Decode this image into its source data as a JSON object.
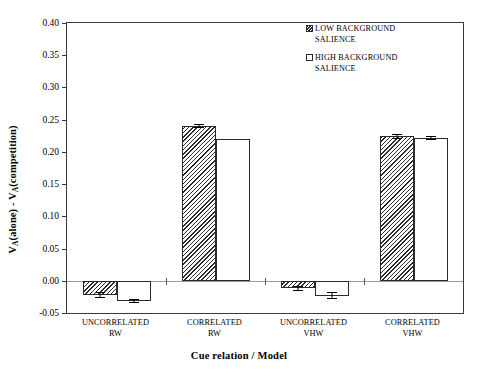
{
  "chart_data": {
    "type": "bar",
    "title": "",
    "xlabel": "Cue relation / Model",
    "ylabel": "Vₐ(alone) - Vₐ(competition)",
    "ylabel_parts": {
      "pre": "V",
      "sub": "A",
      "mid": "(alone) - V",
      "sub2": "A",
      "post": "(competition)"
    },
    "categories": [
      "UNCORRELATED\nRW",
      "CORRELATED\nRW",
      "UNCORRELATED\nVHW",
      "CORRELATED\nVHW"
    ],
    "series": [
      {
        "name": "LOW BACKGROUND\nSALIENCE",
        "swatch": "hatch",
        "values": [
          -0.022,
          0.24,
          -0.012,
          0.224
        ],
        "errors": [
          0.005,
          0.003,
          0.004,
          0.004
        ]
      },
      {
        "name": "HIGH BACKGROUND\nSALIENCE",
        "swatch": "white",
        "values": [
          -0.032,
          0.22,
          -0.023,
          0.222
        ],
        "errors": [
          0.003,
          0.0,
          0.006,
          0.003
        ]
      }
    ],
    "ylim": [
      -0.05,
      0.4
    ],
    "yticks": [
      -0.05,
      0.0,
      0.05,
      0.1,
      0.15,
      0.2,
      0.25,
      0.3,
      0.35,
      0.4
    ],
    "ytick_labels": [
      "-0.05",
      "0.00",
      "0.05",
      "0.10",
      "0.15",
      "0.20",
      "0.25",
      "0.30",
      "0.35",
      "0.40"
    ],
    "grid": false,
    "legend_position": "top-right",
    "zero_line": 0.0,
    "colors": {
      "axis": "#3a3a3a",
      "bar_edge": "#2b2b2b",
      "hatch": "#2b2b2b",
      "white_fill": "#ffffff",
      "zero_line": "#9a9a9a",
      "background": "#ffffff"
    }
  },
  "legend": {
    "items": [
      {
        "label": "LOW BACKGROUND\nSALIENCE",
        "swatch": "hatch"
      },
      {
        "label": "HIGH BACKGROUND\nSALIENCE",
        "swatch": "white"
      }
    ]
  }
}
